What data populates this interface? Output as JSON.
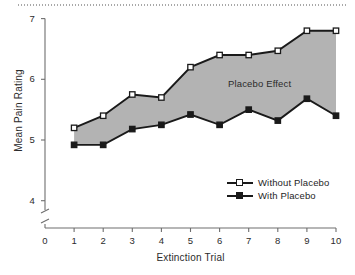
{
  "chart_data": {
    "type": "line",
    "title": "",
    "xlabel": "Extinction Trial",
    "ylabel": "Mean Pain Rating",
    "x": [
      1,
      2,
      3,
      4,
      5,
      6,
      7,
      8,
      9,
      10
    ],
    "xticklabels": [
      "0",
      "1",
      "2",
      "3",
      "4",
      "5",
      "6",
      "7",
      "8",
      "9",
      "10"
    ],
    "yticklabels": [
      "4",
      "5",
      "6",
      "7"
    ],
    "xlim": [
      0,
      10
    ],
    "ylim": [
      4,
      7
    ],
    "yaxis_break": true,
    "grid": false,
    "legend_position": "inside lower right",
    "series": [
      {
        "name": "Without Placebo",
        "marker": "open-square",
        "values": [
          5.2,
          5.4,
          5.75,
          5.7,
          6.2,
          6.4,
          6.4,
          6.47,
          6.8,
          6.8
        ]
      },
      {
        "name": "With Placebo",
        "marker": "filled-square",
        "values": [
          4.92,
          4.92,
          5.18,
          5.25,
          5.42,
          5.25,
          5.5,
          5.32,
          5.68,
          5.4
        ]
      }
    ],
    "annotations": [
      {
        "text": "Placebo Effect",
        "x": 6.3,
        "y": 6.05
      }
    ],
    "shaded_region": {
      "label": "Placebo Effect",
      "between": [
        "Without Placebo",
        "With Placebo"
      ],
      "color": "#b3b3b3"
    },
    "colors": {
      "band": "#b3b3b3",
      "line": "#1a1a1a",
      "axis": "#6e6e6e",
      "text": "#2b2b2b",
      "background": "#ffffff"
    }
  },
  "legend": {
    "items": [
      {
        "label": "Without Placebo",
        "marker": "open-square"
      },
      {
        "label": "With Placebo",
        "marker": "filled-square"
      }
    ]
  }
}
